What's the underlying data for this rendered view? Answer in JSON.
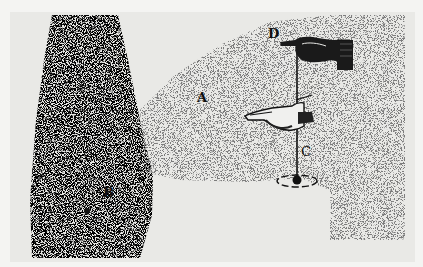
{
  "figure": {
    "labels": {
      "A": "A",
      "B": "B",
      "C": "C",
      "D": "D"
    },
    "colors": {
      "background": "#e9e9e6",
      "border": "#f4f4f2",
      "ink": "#111111"
    }
  }
}
